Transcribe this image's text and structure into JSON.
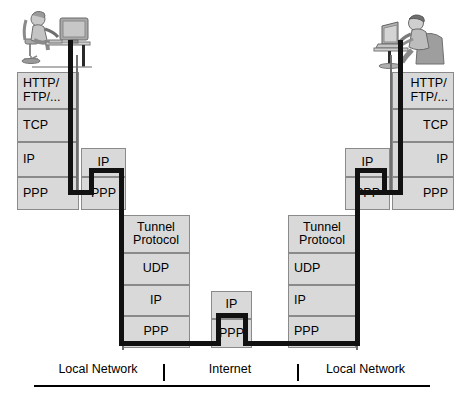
{
  "diagram": {
    "box_fill": "#d9d9d9",
    "box_border": "#8a8a8a",
    "pipe_color": "#111111",
    "stacks": [
      {
        "id": "left-host",
        "role": "client-host-stack",
        "align": "lbl-left",
        "layers": [
          {
            "name": "application-layer",
            "label": "HTTP/\nFTP/..."
          },
          {
            "name": "transport-layer",
            "label": "TCP"
          },
          {
            "name": "network-layer",
            "label": "IP"
          },
          {
            "name": "link-layer",
            "label": "PPP"
          }
        ]
      },
      {
        "id": "left-router",
        "role": "local-router-stack",
        "align": "lbl-center",
        "layers": [
          {
            "name": "network-layer",
            "label": "IP"
          },
          {
            "name": "link-layer",
            "label": "PPP"
          }
        ]
      },
      {
        "id": "left-tunnel",
        "role": "tunnel-endpoint-stack",
        "align": "lbl-center",
        "layers": [
          {
            "name": "tunnel-layer",
            "label": "Tunnel\nProtocol"
          },
          {
            "name": "transport-layer",
            "label": "UDP"
          },
          {
            "name": "network-layer",
            "label": "IP"
          },
          {
            "name": "link-layer",
            "label": "PPP"
          }
        ]
      },
      {
        "id": "internet-router",
        "role": "internet-router-stack",
        "align": "lbl-center",
        "layers": [
          {
            "name": "network-layer",
            "label": "IP"
          },
          {
            "name": "link-layer",
            "label": "PPP"
          }
        ]
      },
      {
        "id": "right-tunnel",
        "role": "tunnel-endpoint-stack",
        "align": "lbl-left",
        "layers": [
          {
            "name": "tunnel-layer",
            "label": "Tunnel\nProtocol"
          },
          {
            "name": "transport-layer",
            "label": "UDP"
          },
          {
            "name": "network-layer",
            "label": "IP"
          },
          {
            "name": "link-layer",
            "label": "PPP"
          }
        ]
      },
      {
        "id": "right-router",
        "role": "local-router-stack",
        "align": "lbl-center",
        "layers": [
          {
            "name": "network-layer",
            "label": "IP"
          },
          {
            "name": "link-layer",
            "label": "PPP"
          }
        ]
      },
      {
        "id": "right-host",
        "role": "client-host-stack",
        "align": "lbl-right",
        "layers": [
          {
            "name": "application-layer",
            "label": "HTTP/\nFTP/..."
          },
          {
            "name": "transport-layer",
            "label": "TCP"
          },
          {
            "name": "network-layer",
            "label": "IP"
          },
          {
            "name": "link-layer",
            "label": "PPP"
          }
        ]
      }
    ],
    "endpoints": [
      {
        "name": "left-user-workstation",
        "kind": "person-at-desktop-computer"
      },
      {
        "name": "right-user-laptop",
        "kind": "person-with-laptop"
      }
    ],
    "regions": [
      {
        "name": "local-network-left",
        "label": "Local Network"
      },
      {
        "name": "internet",
        "label": "Internet"
      },
      {
        "name": "local-network-right",
        "label": "Local Network"
      }
    ]
  }
}
